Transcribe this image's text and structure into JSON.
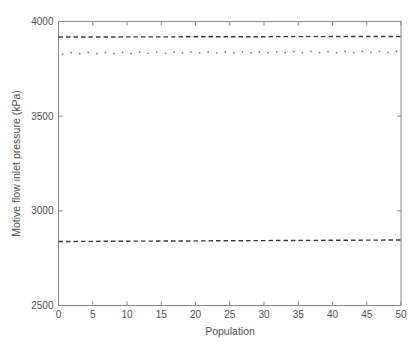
{
  "chart_data": {
    "type": "line",
    "title": "",
    "xlabel": "Population",
    "ylabel": "Motive flow inlet pressure (kPa)",
    "xlim": [
      0,
      50
    ],
    "ylim": [
      2500,
      4000
    ],
    "xticks": [
      0,
      5,
      10,
      15,
      20,
      25,
      30,
      35,
      40,
      45,
      50
    ],
    "yticks": [
      2500,
      3000,
      3500,
      4000
    ],
    "grid": false,
    "legend": "none",
    "frame_color": "#8a8a8a",
    "text_color": "#4f4f4f",
    "series": [
      {
        "name": "upper-bound-dashed",
        "style": "dashed",
        "color": "#3b3b3b",
        "x": [
          0,
          50
        ],
        "y": [
          3918,
          3921
        ]
      },
      {
        "name": "mean-dotted",
        "style": "dotted",
        "color": "#7b7b7b",
        "x": [
          0.6,
          1.85,
          3.1,
          4.35,
          5.6,
          6.85,
          8.1,
          9.35,
          10.6,
          11.85,
          13.1,
          14.35,
          15.6,
          16.85,
          18.1,
          19.35,
          20.6,
          21.85,
          23.1,
          24.35,
          25.6,
          26.85,
          28.1,
          29.35,
          30.6,
          31.85,
          33.1,
          34.35,
          35.6,
          36.85,
          38.1,
          39.35,
          40.6,
          41.85,
          43.1,
          44.35,
          45.6,
          46.85,
          48.1,
          49.35
        ],
        "y": [
          3829,
          3836,
          3830,
          3837,
          3830,
          3836,
          3831,
          3837,
          3831,
          3838,
          3832,
          3838,
          3832,
          3838,
          3833,
          3839,
          3833,
          3839,
          3834,
          3839,
          3834,
          3840,
          3834,
          3840,
          3835,
          3840,
          3835,
          3841,
          3835,
          3841,
          3836,
          3841,
          3836,
          3842,
          3836,
          3842,
          3837,
          3842,
          3837,
          3843
        ]
      },
      {
        "name": "lower-bound-dashed",
        "style": "dashed",
        "color": "#3b3b3b",
        "x": [
          0,
          50
        ],
        "y": [
          2838,
          2846
        ]
      }
    ]
  }
}
